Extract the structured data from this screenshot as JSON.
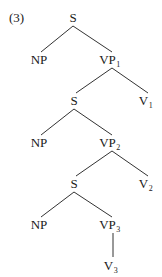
{
  "example_number": "(3)",
  "tree": {
    "nodes": [
      {
        "id": "s0",
        "label": "S",
        "sub": "",
        "x": 73,
        "y": 22
      },
      {
        "id": "np0",
        "label": "NP",
        "sub": "",
        "x": 39,
        "y": 64
      },
      {
        "id": "vp1",
        "label": "VP",
        "sub": "1",
        "x": 110,
        "y": 64
      },
      {
        "id": "s1",
        "label": "S",
        "sub": "",
        "x": 74,
        "y": 105
      },
      {
        "id": "v1",
        "label": "V",
        "sub": "1",
        "x": 146,
        "y": 105
      },
      {
        "id": "np1",
        "label": "NP",
        "sub": "",
        "x": 39,
        "y": 147
      },
      {
        "id": "vp2",
        "label": "VP",
        "sub": "2",
        "x": 110,
        "y": 147
      },
      {
        "id": "s2",
        "label": "S",
        "sub": "",
        "x": 74,
        "y": 188
      },
      {
        "id": "v2",
        "label": "V",
        "sub": "2",
        "x": 146,
        "y": 188
      },
      {
        "id": "np2",
        "label": "NP",
        "sub": "",
        "x": 39,
        "y": 229
      },
      {
        "id": "vp3",
        "label": "VP",
        "sub": "3",
        "x": 110,
        "y": 229
      },
      {
        "id": "v3",
        "label": "V",
        "sub": "3",
        "x": 111,
        "y": 270
      }
    ],
    "edges": [
      {
        "from": "s0",
        "to": "np0",
        "x1": 73,
        "y1": 26,
        "x2": 41,
        "y2": 52
      },
      {
        "from": "s0",
        "to": "vp1",
        "x1": 73,
        "y1": 26,
        "x2": 112,
        "y2": 52
      },
      {
        "from": "vp1",
        "to": "s1",
        "x1": 112,
        "y1": 68,
        "x2": 76,
        "y2": 93
      },
      {
        "from": "vp1",
        "to": "v1",
        "x1": 112,
        "y1": 68,
        "x2": 148,
        "y2": 93
      },
      {
        "from": "s1",
        "to": "np1",
        "x1": 74,
        "y1": 109,
        "x2": 41,
        "y2": 135
      },
      {
        "from": "s1",
        "to": "vp2",
        "x1": 74,
        "y1": 109,
        "x2": 112,
        "y2": 135
      },
      {
        "from": "vp2",
        "to": "s2",
        "x1": 112,
        "y1": 151,
        "x2": 76,
        "y2": 176
      },
      {
        "from": "vp2",
        "to": "v2",
        "x1": 112,
        "y1": 151,
        "x2": 148,
        "y2": 176
      },
      {
        "from": "s2",
        "to": "np2",
        "x1": 74,
        "y1": 192,
        "x2": 41,
        "y2": 217
      },
      {
        "from": "s2",
        "to": "vp3",
        "x1": 74,
        "y1": 192,
        "x2": 112,
        "y2": 217
      },
      {
        "from": "vp3",
        "to": "v3",
        "x1": 113,
        "y1": 233,
        "x2": 113,
        "y2": 257
      }
    ]
  }
}
